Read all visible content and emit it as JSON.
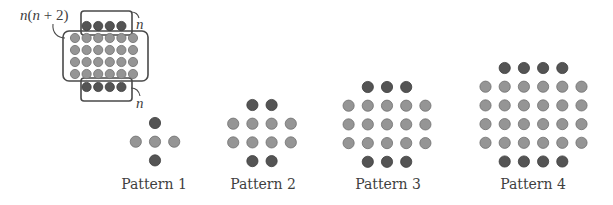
{
  "colors": {
    "dark_dot": "#545454",
    "dark_dot_edge": "#3c3c3c",
    "light_dot": "#959595",
    "light_dot_edge": "#6f6f6f",
    "text": "#3f3f3f"
  },
  "diagram": {
    "formula_label": "n(n + 2)",
    "formula_parts": {
      "n1": "n",
      "open": "(",
      "n2": "n",
      "plus": " + 2)"
    },
    "top_side_label": "n",
    "bottom_side_label": "n",
    "dot_radius": 4.6,
    "rows": [
      {
        "role": "top",
        "count": 4,
        "y": 26
      },
      {
        "role": "middle",
        "count": 6,
        "y": 38
      },
      {
        "role": "middle",
        "count": 6,
        "y": 50
      },
      {
        "role": "middle",
        "count": 6,
        "y": 62
      },
      {
        "role": "middle",
        "count": 6,
        "y": 74
      },
      {
        "role": "bottom",
        "count": 4,
        "y": 87
      }
    ],
    "center_x": 104,
    "spacing": 11.6
  },
  "patterns": [
    {
      "label": "Pattern 1",
      "n": 1,
      "center_x": 155,
      "top_y": 123,
      "label_x": 154,
      "rows": [
        {
          "role": "top",
          "count": 1
        },
        {
          "role": "middle",
          "count": 3
        },
        {
          "role": "bottom",
          "count": 1
        }
      ],
      "total_dots": 5
    },
    {
      "label": "Pattern 2",
      "n": 2,
      "center_x": 262,
      "top_y": 105,
      "label_x": 263,
      "rows": [
        {
          "role": "top",
          "count": 2
        },
        {
          "role": "middle",
          "count": 4
        },
        {
          "role": "middle",
          "count": 4
        },
        {
          "role": "bottom",
          "count": 2
        }
      ],
      "total_dots": 12
    },
    {
      "label": "Pattern 3",
      "n": 3,
      "center_x": 387,
      "top_y": 87,
      "label_x": 388,
      "rows": [
        {
          "role": "top",
          "count": 3
        },
        {
          "role": "middle",
          "count": 5
        },
        {
          "role": "middle",
          "count": 5
        },
        {
          "role": "middle",
          "count": 5
        },
        {
          "role": "bottom",
          "count": 3
        }
      ],
      "total_dots": 21
    },
    {
      "label": "Pattern 4",
      "n": 4,
      "center_x": 533.5,
      "top_y": 68,
      "label_x": 533,
      "rows": [
        {
          "role": "top",
          "count": 4
        },
        {
          "role": "middle",
          "count": 6
        },
        {
          "role": "middle",
          "count": 6
        },
        {
          "role": "middle",
          "count": 6
        },
        {
          "role": "middle",
          "count": 6
        },
        {
          "role": "bottom",
          "count": 4
        }
      ],
      "total_dots": 32
    }
  ],
  "pattern_layout": {
    "spacing_x": 19.2,
    "spacing_y": 18.7,
    "dot_radius": 5.6,
    "label_y": 189
  }
}
